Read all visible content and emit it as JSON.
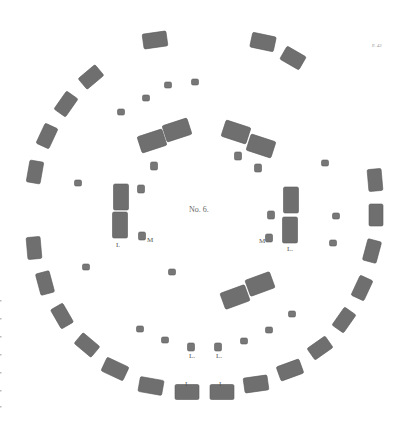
{
  "plate": {
    "title": "No. 6.",
    "page_mark": "P. 42",
    "colors": {
      "stone": "#6f6f6f",
      "background": "#ffffff",
      "label": "#555555"
    }
  },
  "labels": {
    "left_trilithon": "I.",
    "left_small": "M",
    "right_small": "M",
    "right_trilithon": "L.",
    "bottom_left_1": "L.",
    "bottom_left_2": "L.",
    "bottom_outer_1": "I",
    "bottom_outer_2": "I"
  },
  "outer_ring": {
    "stones": [
      {
        "x": 155,
        "y": 40,
        "w": 24,
        "h": 15,
        "r": -8
      },
      {
        "x": 263,
        "y": 42,
        "w": 24,
        "h": 15,
        "r": 12
      },
      {
        "x": 293,
        "y": 58,
        "w": 22,
        "h": 15,
        "r": 30
      },
      {
        "x": 91,
        "y": 77,
        "w": 22,
        "h": 14,
        "r": -40
      },
      {
        "x": 66,
        "y": 104,
        "w": 22,
        "h": 14,
        "r": -55
      },
      {
        "x": 47,
        "y": 136,
        "w": 22,
        "h": 14,
        "r": -65
      },
      {
        "x": 35,
        "y": 172,
        "w": 22,
        "h": 14,
        "r": -80
      },
      {
        "x": 375,
        "y": 180,
        "w": 22,
        "h": 14,
        "r": 85
      },
      {
        "x": 376,
        "y": 215,
        "w": 22,
        "h": 14,
        "r": 90
      },
      {
        "x": 372,
        "y": 251,
        "w": 22,
        "h": 14,
        "r": 105
      },
      {
        "x": 362,
        "y": 288,
        "w": 22,
        "h": 14,
        "r": 115
      },
      {
        "x": 34,
        "y": 248,
        "w": 22,
        "h": 14,
        "r": 85
      },
      {
        "x": 45,
        "y": 283,
        "w": 22,
        "h": 14,
        "r": 75
      },
      {
        "x": 62,
        "y": 316,
        "w": 22,
        "h": 14,
        "r": 60
      },
      {
        "x": 87,
        "y": 345,
        "w": 22,
        "h": 14,
        "r": 40
      },
      {
        "x": 115,
        "y": 369,
        "w": 24,
        "h": 15,
        "r": 25
      },
      {
        "x": 151,
        "y": 386,
        "w": 24,
        "h": 15,
        "r": 10
      },
      {
        "x": 187,
        "y": 392,
        "w": 24,
        "h": 15,
        "r": 0
      },
      {
        "x": 222,
        "y": 392,
        "w": 24,
        "h": 15,
        "r": 0
      },
      {
        "x": 256,
        "y": 384,
        "w": 24,
        "h": 15,
        "r": -8
      },
      {
        "x": 290,
        "y": 370,
        "w": 24,
        "h": 15,
        "r": -20
      },
      {
        "x": 320,
        "y": 348,
        "w": 22,
        "h": 14,
        "r": -35
      },
      {
        "x": 344,
        "y": 320,
        "w": 22,
        "h": 14,
        "r": -55
      }
    ]
  },
  "inner_ring_small": {
    "stones": [
      {
        "x": 146,
        "y": 98
      },
      {
        "x": 168,
        "y": 85
      },
      {
        "x": 195,
        "y": 82
      },
      {
        "x": 121,
        "y": 112
      },
      {
        "x": 78,
        "y": 183
      },
      {
        "x": 86,
        "y": 267
      },
      {
        "x": 325,
        "y": 163
      },
      {
        "x": 336,
        "y": 216
      },
      {
        "x": 333,
        "y": 243
      },
      {
        "x": 140,
        "y": 329
      },
      {
        "x": 165,
        "y": 340
      },
      {
        "x": 244,
        "y": 341
      },
      {
        "x": 269,
        "y": 330
      },
      {
        "x": 292,
        "y": 314
      },
      {
        "x": 172,
        "y": 272
      }
    ]
  },
  "trilithons": [
    {
      "name": "top-left",
      "stones": [
        {
          "x": 152,
          "y": 141,
          "w": 26,
          "h": 17,
          "r": -18
        },
        {
          "x": 177,
          "y": 130,
          "w": 26,
          "h": 17,
          "r": -18
        }
      ]
    },
    {
      "name": "top-right",
      "stones": [
        {
          "x": 236,
          "y": 132,
          "w": 26,
          "h": 17,
          "r": 18
        },
        {
          "x": 261,
          "y": 146,
          "w": 26,
          "h": 17,
          "r": 18
        }
      ]
    },
    {
      "name": "left",
      "stones": [
        {
          "x": 121,
          "y": 197,
          "w": 15,
          "h": 26,
          "r": 0
        },
        {
          "x": 120,
          "y": 225,
          "w": 15,
          "h": 26,
          "r": 0
        }
      ]
    },
    {
      "name": "right",
      "stones": [
        {
          "x": 291,
          "y": 200,
          "w": 15,
          "h": 26,
          "r": 0
        },
        {
          "x": 290,
          "y": 230,
          "w": 15,
          "h": 26,
          "r": 0
        }
      ]
    },
    {
      "name": "bottom",
      "stones": [
        {
          "x": 235,
          "y": 297,
          "w": 26,
          "h": 17,
          "r": -20
        },
        {
          "x": 260,
          "y": 284,
          "w": 26,
          "h": 17,
          "r": -20
        }
      ]
    }
  ],
  "inner_small_near": [
    {
      "x": 141,
      "y": 189
    },
    {
      "x": 142,
      "y": 236
    },
    {
      "x": 271,
      "y": 215
    },
    {
      "x": 269,
      "y": 238
    },
    {
      "x": 154,
      "y": 166
    },
    {
      "x": 238,
      "y": 156
    },
    {
      "x": 258,
      "y": 168
    },
    {
      "x": 191,
      "y": 347
    },
    {
      "x": 218,
      "y": 347
    }
  ]
}
